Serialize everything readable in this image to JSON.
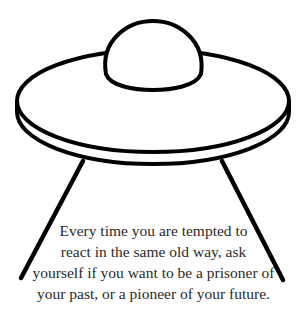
{
  "illustration": {
    "subject": "ufo-with-tractor-beam",
    "stroke_color": "#000000",
    "background_color": "#ffffff"
  },
  "quote": {
    "lines": [
      "Every time you are tempted to",
      "react in the same old way, ask",
      "yourself if you want to be a prisoner of",
      "your past, or a pioneer of your future."
    ],
    "text_color": "#2a2a2a"
  }
}
